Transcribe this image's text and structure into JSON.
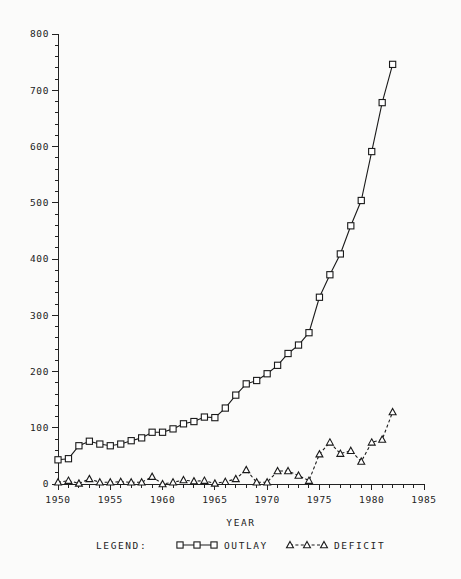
{
  "chart_data": {
    "type": "line",
    "title": "",
    "xlabel": "YEAR",
    "ylabel": "",
    "xlim": [
      1950,
      1985
    ],
    "ylim": [
      0,
      800
    ],
    "grid": false,
    "legend_position": "bottom",
    "x": [
      1950,
      1951,
      1952,
      1953,
      1954,
      1955,
      1956,
      1957,
      1958,
      1959,
      1960,
      1961,
      1962,
      1963,
      1964,
      1965,
      1966,
      1967,
      1968,
      1969,
      1970,
      1971,
      1972,
      1973,
      1974,
      1975,
      1976,
      1977,
      1978,
      1979,
      1980,
      1981,
      1982
    ],
    "series": [
      {
        "name": "OUTLAY",
        "marker": "square",
        "linestyle": "solid",
        "values": [
          43,
          45,
          68,
          76,
          71,
          68,
          71,
          77,
          82,
          92,
          92,
          98,
          107,
          111,
          119,
          118,
          135,
          158,
          178,
          184,
          196,
          211,
          232,
          247,
          269,
          332,
          372,
          409,
          459,
          504,
          591,
          678,
          746
        ]
      },
      {
        "name": "DEFICIT",
        "marker": "triangle",
        "linestyle": "dashed",
        "values": [
          3,
          6,
          1,
          9,
          3,
          3,
          4,
          3,
          3,
          13,
          0,
          3,
          7,
          5,
          6,
          1,
          4,
          9,
          25,
          3,
          3,
          23,
          23,
          15,
          6,
          53,
          74,
          54,
          59,
          40,
          74,
          79,
          128
        ]
      }
    ],
    "yticks": [
      0,
      100,
      200,
      300,
      400,
      500,
      600,
      700,
      800
    ],
    "ytick_labels": [
      "0",
      "100",
      "200",
      "300",
      "400",
      "500",
      "600",
      "700",
      "800"
    ],
    "xticks": [
      1950,
      1955,
      1960,
      1965,
      1970,
      1975,
      1980,
      1985
    ],
    "xtick_labels": [
      "1950",
      "1955",
      "1960",
      "1965",
      "1970",
      "1975",
      "1980",
      "1985"
    ],
    "y_minor_step": 20,
    "x_minor_step": 1
  },
  "legend": {
    "label": "LEGEND:",
    "entries": [
      {
        "name": "OUTLAY",
        "marker": "square",
        "linestyle": "solid"
      },
      {
        "name": "DEFICIT",
        "marker": "triangle",
        "linestyle": "dashed"
      }
    ]
  },
  "axis": {
    "x_title": "YEAR"
  },
  "colors": {
    "ink": "#1a1a1a",
    "background": "#fbfbfa"
  },
  "plot_pixels": {
    "note": "scaled plotting values as drawn on the 0-800 axis",
    "outlay_plotted": [
      43,
      45,
      68,
      76,
      71,
      68,
      71,
      77,
      82,
      92,
      92,
      98,
      107,
      111,
      119,
      118,
      135,
      158,
      178,
      184,
      196,
      211,
      232,
      247,
      269,
      332,
      372,
      409,
      459,
      504,
      591,
      678,
      746
    ]
  }
}
